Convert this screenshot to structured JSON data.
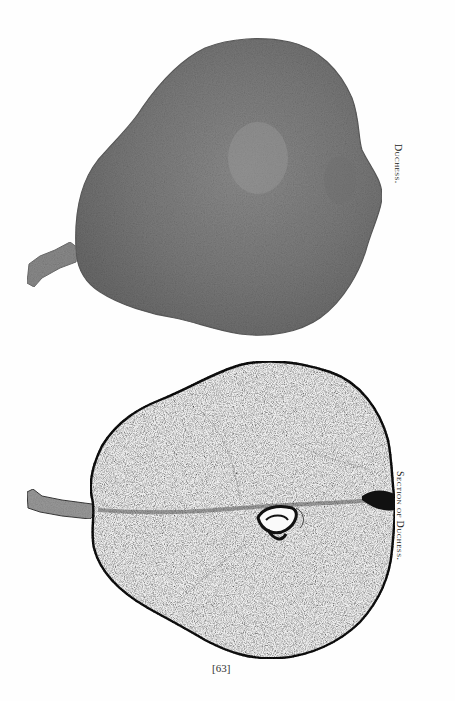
{
  "page": {
    "folio": "[63]",
    "figures": [
      {
        "id": "whole",
        "caption": "Duchess.",
        "description": "Whole pear, stippled grey halftone, stem pointing left",
        "fill_color": "#7a7a7a"
      },
      {
        "id": "section",
        "caption": "Section of Duchess.",
        "description": "Longitudinal section of pear, white flesh with dark outline and core with seeds",
        "fill_color": "#ececec",
        "outline_color": "#1a1a1a"
      }
    ]
  }
}
